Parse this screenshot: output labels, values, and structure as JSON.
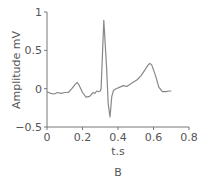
{
  "chart_data": {
    "type": "line",
    "title": "",
    "panel_label": "B",
    "xlabel": "t.s",
    "ylabel": "Amplitude mV",
    "xlim": [
      0,
      0.8
    ],
    "ylim": [
      -0.5,
      1
    ],
    "x_ticks": [
      0,
      0.2,
      0.4,
      0.6,
      0.8
    ],
    "x_tick_labels": [
      "0",
      "0.2",
      "0.4",
      "0.6",
      "0.8"
    ],
    "y_ticks": [
      -0.5,
      0,
      0.5,
      1
    ],
    "y_tick_labels": [
      "−0.5",
      "0",
      "0.5",
      "1"
    ],
    "grid": false,
    "legend": null,
    "series": [
      {
        "name": "ECG",
        "color": "#888888",
        "x": [
          0.0,
          0.02,
          0.04,
          0.06,
          0.08,
          0.1,
          0.12,
          0.14,
          0.16,
          0.17,
          0.18,
          0.2,
          0.22,
          0.24,
          0.26,
          0.27,
          0.28,
          0.29,
          0.3,
          0.305,
          0.32,
          0.335,
          0.345,
          0.355,
          0.365,
          0.375,
          0.39,
          0.41,
          0.43,
          0.45,
          0.47,
          0.49,
          0.51,
          0.53,
          0.55,
          0.57,
          0.58,
          0.59,
          0.61,
          0.63,
          0.65,
          0.67,
          0.69,
          0.7
        ],
        "values": [
          -0.04,
          -0.06,
          -0.07,
          -0.05,
          -0.06,
          -0.05,
          -0.05,
          0.0,
          0.06,
          0.08,
          0.05,
          -0.05,
          -0.11,
          -0.1,
          -0.05,
          -0.06,
          -0.03,
          -0.04,
          -0.03,
          0.0,
          0.89,
          0.3,
          -0.2,
          -0.37,
          -0.1,
          -0.02,
          0.0,
          0.02,
          0.04,
          0.03,
          0.06,
          0.09,
          0.12,
          0.17,
          0.24,
          0.31,
          0.33,
          0.31,
          0.18,
          0.02,
          -0.04,
          -0.04,
          -0.03,
          -0.03
        ]
      }
    ]
  }
}
